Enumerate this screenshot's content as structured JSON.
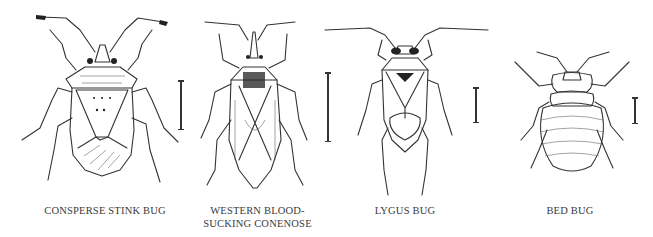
{
  "figure": {
    "panels": [
      {
        "id": "consperse-stink-bug",
        "caption": "CONSPERSE STINK BUG",
        "has_scale_bar": true
      },
      {
        "id": "western-blood-sucking-conenose",
        "caption": "WESTERN BLOOD-\nSUCKING CONENOSE",
        "has_scale_bar": true
      },
      {
        "id": "lygus-bug",
        "caption": "LYGUS BUG",
        "has_scale_bar": true
      },
      {
        "id": "bed-bug",
        "caption": "BED BUG",
        "has_scale_bar": true
      }
    ],
    "colors": {
      "ink": "#333333",
      "caption": "#3a3a3a",
      "background": "#ffffff"
    }
  }
}
